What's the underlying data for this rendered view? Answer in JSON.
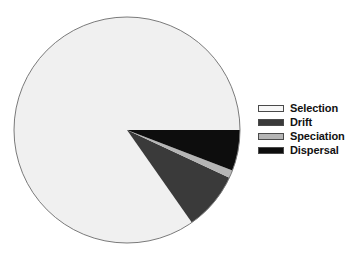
{
  "chart_data": {
    "type": "pie",
    "title": "",
    "subtitle": "",
    "xlabel": "",
    "ylabel": "",
    "grid": false,
    "legend_position": "right",
    "start_angle_deg": 0,
    "direction": "clockwise",
    "center": {
      "x": 127,
      "y": 130
    },
    "radius": 113,
    "categories": [
      "Selection",
      "Drift",
      "Speciation",
      "Dispersal"
    ],
    "values": [
      84.8,
      8.3,
      1.1,
      5.8
    ],
    "units": "percent",
    "slices": [
      {
        "label": "Selection",
        "value": 84.8,
        "color": "#f0f0f0",
        "start_angle_deg": 55,
        "end_angle_deg": 360
      },
      {
        "label": "Drift",
        "value": 8.3,
        "color": "#3a3a3a",
        "start_angle_deg": 25,
        "end_angle_deg": 55
      },
      {
        "label": "Speciation",
        "value": 1.1,
        "color": "#b5b5b5",
        "start_angle_deg": 21,
        "end_angle_deg": 25
      },
      {
        "label": "Dispersal",
        "value": 5.8,
        "color": "#0d0d0d",
        "start_angle_deg": 0,
        "end_angle_deg": 21
      }
    ],
    "outline_color": "#7a7a7a"
  },
  "legend": {
    "entries": [
      {
        "label": "Selection",
        "color": "#f7f7f7",
        "swatch": "legend-swatch-selection"
      },
      {
        "label": "Drift",
        "color": "#3a3a3a",
        "swatch": "legend-swatch-drift"
      },
      {
        "label": "Speciation",
        "color": "#b5b5b5",
        "swatch": "legend-swatch-speciation"
      },
      {
        "label": "Dispersal",
        "color": "#0d0d0d",
        "swatch": "legend-swatch-dispersal"
      }
    ]
  },
  "colors": {
    "background": "#ffffff",
    "selection": "#f0f0f0",
    "drift": "#3a3a3a",
    "speciation": "#b5b5b5",
    "dispersal": "#0d0d0d",
    "outline": "#7a7a7a",
    "text": "#111111"
  }
}
